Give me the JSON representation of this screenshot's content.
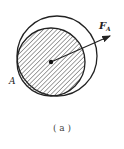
{
  "figure": {
    "point_label": "A",
    "force_label": "F",
    "force_subscript": "A",
    "caption": "( a )"
  },
  "colors": {
    "stroke": "#222222",
    "hatch": "#444444",
    "background": "#ffffff"
  }
}
